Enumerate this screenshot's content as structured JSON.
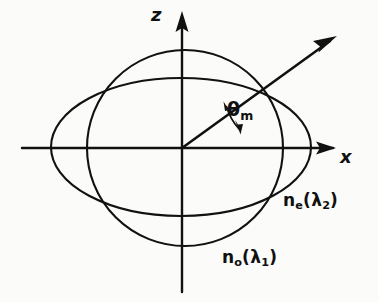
{
  "figure": {
    "kind": "optical-index-surface-diagram",
    "background_color": "#fbfbfa",
    "ink_color": "#111111",
    "axes": {
      "vertical_label": "z",
      "horizontal_label": "x",
      "origin": {
        "x": 182,
        "y": 148
      }
    },
    "angle": {
      "symbol": "θ",
      "subscript": "m",
      "value_degrees": 34,
      "arc_radius": 58
    },
    "curves": [
      {
        "name": "ordinary-index-circle",
        "label_base": "n",
        "label_sub": "o",
        "label_arg_open": "(",
        "label_arg": "λ",
        "label_arg_sub": "1",
        "label_arg_close": ")",
        "center": {
          "x": 185,
          "y": 148
        },
        "rx": 98,
        "ry": 98
      },
      {
        "name": "extraordinary-index-ellipse",
        "label_base": "n",
        "label_sub": "e",
        "label_arg_open": "(",
        "label_arg": "λ",
        "label_arg_sub": "2",
        "label_arg_close": ")",
        "center": {
          "x": 181,
          "y": 147
        },
        "rx": 130,
        "ry": 69
      }
    ],
    "ray": {
      "name": "phase-matching-ray",
      "from": {
        "x": 182,
        "y": 148
      },
      "to": {
        "x": 337,
        "y": 36
      },
      "intersection": {
        "x": 256,
        "y": 89
      }
    },
    "labels": {
      "z": "z",
      "x": "x",
      "theta": "θ",
      "theta_sub": "m",
      "n": "n",
      "sub_o": "o",
      "sub_e": "e",
      "lambda": "λ",
      "sub_1": "1",
      "sub_2": "2",
      "paren_open": "(",
      "paren_close": ")"
    }
  }
}
